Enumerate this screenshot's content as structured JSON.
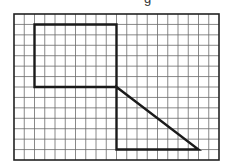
{
  "caption_fragment": "g",
  "grid": {
    "columns": 20,
    "rows": 14,
    "line_color": "#6b6b6b",
    "border_color": "#222222"
  },
  "shapes": [
    {
      "name": "rectangle",
      "stroke": "#1a1a1a",
      "points": [
        [
          2,
          1
        ],
        [
          10,
          1
        ],
        [
          10,
          7
        ],
        [
          2,
          7
        ]
      ],
      "closed": true
    },
    {
      "name": "right-triangle",
      "stroke": "#1a1a1a",
      "points": [
        [
          10,
          7
        ],
        [
          18,
          13
        ],
        [
          10,
          13
        ]
      ],
      "closed": true
    }
  ]
}
